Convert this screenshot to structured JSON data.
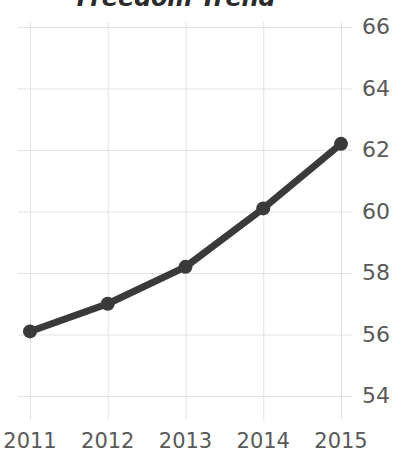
{
  "chart_data": {
    "type": "line",
    "title": "Freedom Trend",
    "xlabel": "",
    "ylabel": "",
    "categories": [
      "2011",
      "2012",
      "2013",
      "2014",
      "2015"
    ],
    "x": [
      2011,
      2012,
      2013,
      2014,
      2015
    ],
    "values": [
      56.1,
      57.0,
      58.2,
      60.1,
      62.2
    ],
    "series": [
      {
        "name": "Freedom Trend",
        "values": [
          56.1,
          57.0,
          58.2,
          60.1,
          62.2
        ]
      }
    ],
    "ylim": [
      54,
      66
    ],
    "yticks": [
      54,
      56,
      58,
      60,
      62,
      64,
      66
    ],
    "ytick_labels": [
      "54",
      "56",
      "58",
      "60",
      "62",
      "64",
      "66"
    ],
    "xtick_labels": [
      "2011",
      "2012",
      "2013",
      "2014",
      "2015"
    ],
    "grid": true,
    "grid_color": "#e2e2e2",
    "legend": false,
    "legend_position": "none",
    "line_color": "#3a3a3a",
    "marker": "circle",
    "marker_color": "#3a3a3a",
    "title_color": "#2b2b2b",
    "tick_label_color": "#595959",
    "background_color": "#ffffff",
    "y_axis_position": "right",
    "annotations": []
  }
}
